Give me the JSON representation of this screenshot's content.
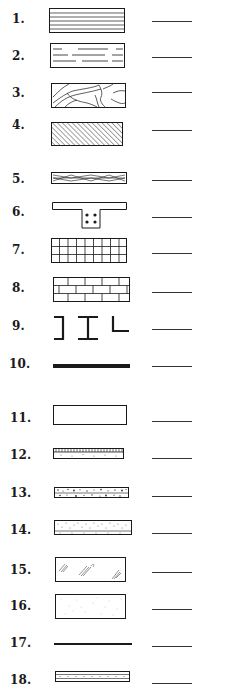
{
  "worksheet": {
    "title": "Architectural material symbols identification",
    "colors": {
      "ink": "#1a1a1a",
      "blank_line": "#333333",
      "background": "#ffffff"
    },
    "items": [
      {
        "number": "1.",
        "symbol": "horizontal-parallel-lines-pattern",
        "answer": ""
      },
      {
        "number": "2.",
        "symbol": "broken-dashed-lines-pattern",
        "answer": ""
      },
      {
        "number": "3.",
        "symbol": "irregular-stone-pattern",
        "answer": ""
      },
      {
        "number": "4.",
        "symbol": "diagonal-hatch-pattern",
        "answer": ""
      },
      {
        "number": "5.",
        "symbol": "wood-grain-pattern",
        "answer": ""
      },
      {
        "number": "6.",
        "symbol": "tee-beam-with-rebar",
        "answer": ""
      },
      {
        "number": "7.",
        "symbol": "square-grid-tile-pattern",
        "answer": ""
      },
      {
        "number": "8.",
        "symbol": "running-bond-brick-pattern",
        "answer": ""
      },
      {
        "number": "9.",
        "symbol": "steel-shapes-channel-ibeam-angle",
        "answer": ""
      },
      {
        "number": "10.",
        "symbol": "thick-solid-bar",
        "answer": ""
      },
      {
        "number": "11.",
        "symbol": "empty-rectangle",
        "answer": ""
      },
      {
        "number": "12.",
        "symbol": "tick-marked-stippled-strip",
        "answer": ""
      },
      {
        "number": "13.",
        "symbol": "aggregate-stipple-strip",
        "answer": ""
      },
      {
        "number": "14.",
        "symbol": "fine-stipple-strip",
        "answer": ""
      },
      {
        "number": "15.",
        "symbol": "glass-reflection-marks",
        "answer": ""
      },
      {
        "number": "16.",
        "symbol": "light-stipple-rectangle",
        "answer": ""
      },
      {
        "number": "17.",
        "symbol": "thin-solid-line",
        "answer": ""
      },
      {
        "number": "18.",
        "symbol": "layered-stipple-strip",
        "answer": ""
      }
    ]
  }
}
